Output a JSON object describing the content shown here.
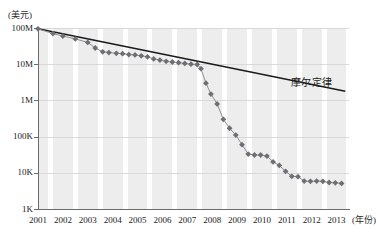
{
  "chart_data": {
    "type": "line",
    "title": "",
    "subtitle": "",
    "xlabel": "(年份)",
    "ylabel": "(美元)",
    "y_unit_caption": "(美元)",
    "x_unit_caption": "(年份)",
    "grid": true,
    "legend_position": "inline-annotation",
    "y_scale": "log",
    "ylim": [
      1000,
      100000000
    ],
    "xlim": [
      2001,
      2013.5
    ],
    "y_ticks": [
      {
        "value": 100000000,
        "label": "100M"
      },
      {
        "value": 10000000,
        "label": "10M"
      },
      {
        "value": 1000000,
        "label": "1M"
      },
      {
        "value": 100000,
        "label": "100K"
      },
      {
        "value": 10000,
        "label": "10K"
      },
      {
        "value": 1000,
        "label": "1K"
      }
    ],
    "x_ticks": [
      "2001",
      "2002",
      "2003",
      "2004",
      "2005",
      "2006",
      "2007",
      "2008",
      "2009",
      "2010",
      "2011",
      "2012",
      "2013"
    ],
    "annotations": [
      {
        "text": "摩尔定律",
        "x": 2011.15,
        "y": 3000000
      }
    ],
    "series": [
      {
        "name": "摩尔定律",
        "style": "solid-line",
        "color": "#1a1a1a",
        "markers": false,
        "x": [
          2001.0,
          2013.35
        ],
        "values": [
          95000000,
          1800000
        ]
      },
      {
        "name": "测序成本",
        "style": "line-with-diamond-markers",
        "color": "#6e6e74",
        "markers": true,
        "x": [
          2001.0,
          2001.6,
          2002.0,
          2002.5,
          2003.0,
          2003.3,
          2003.6,
          2003.85,
          2004.15,
          2004.4,
          2004.65,
          2004.9,
          2005.15,
          2005.4,
          2005.65,
          2005.9,
          2006.15,
          2006.4,
          2006.65,
          2006.9,
          2007.15,
          2007.4,
          2007.55,
          2007.75,
          2007.95,
          2008.2,
          2008.45,
          2008.7,
          2008.95,
          2009.2,
          2009.45,
          2009.7,
          2009.95,
          2010.2,
          2010.45,
          2010.7,
          2010.95,
          2011.2,
          2011.45,
          2011.7,
          2011.95,
          2012.2,
          2012.45,
          2012.7,
          2012.95,
          2013.2
        ],
        "values": [
          95000000,
          70000000,
          60000000,
          50000000,
          40000000,
          28000000,
          22000000,
          21000000,
          20000000,
          19500000,
          18500000,
          18000000,
          17000000,
          16000000,
          14000000,
          13000000,
          12000000,
          11500000,
          11000000,
          10500000,
          10000000,
          9800000,
          7500000,
          3000000,
          1500000,
          800000,
          300000,
          170000,
          110000,
          60000,
          33000,
          31000,
          31000,
          29000,
          20000,
          16000,
          11000,
          8000,
          7800,
          5900,
          5800,
          5900,
          5800,
          5400,
          5300,
          5100
        ]
      }
    ]
  }
}
